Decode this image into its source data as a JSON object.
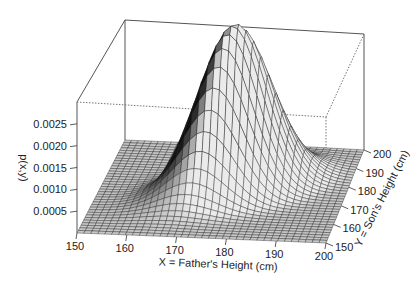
{
  "chart_data": {
    "type": "surface3d",
    "title": "",
    "zlabel": "p(x,y)",
    "xlabel": "X = Father's Height (cm)",
    "ylabel": "Y = Son's Height (cm)",
    "x_ticks": [
      "150",
      "160",
      "170",
      "180",
      "190",
      "200"
    ],
    "y_ticks": [
      "150",
      "160",
      "170",
      "180",
      "190",
      "200"
    ],
    "z_ticks": [
      "0.0005",
      "0.0010",
      "0.0015",
      "0.0020",
      "0.0025"
    ],
    "xlim": [
      150,
      200
    ],
    "ylim": [
      150,
      200
    ],
    "zlim": [
      0,
      0.003
    ],
    "distribution": "bivariate normal",
    "peak": {
      "x": 178,
      "y": 178,
      "z": 0.0028
    },
    "grid": "mesh surface, shaded grayscale",
    "box": true
  }
}
